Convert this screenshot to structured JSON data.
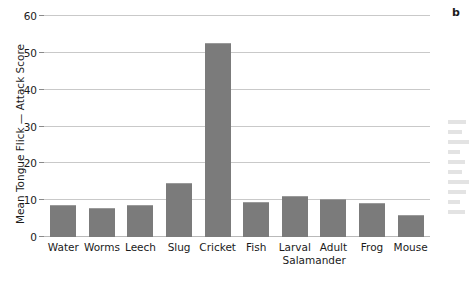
{
  "panel": {
    "letter": "b"
  },
  "chart_data": {
    "type": "bar",
    "title": "",
    "xlabel": "",
    "ylabel": "Mean Tongue Flick — Attack Score",
    "ylim": [
      0,
      60
    ],
    "yticks": [
      0,
      10,
      20,
      30,
      40,
      50,
      60
    ],
    "ytick_labels": [
      "0",
      "10",
      "20",
      "30",
      "40",
      "50",
      "60"
    ],
    "grid": true,
    "legend": "none",
    "bar_color": "#7b7b7b",
    "gridline_color": "#c9c9c9",
    "categories": [
      "Water",
      "Worms",
      "Leech",
      "Slug",
      "Cricket",
      "Fish",
      "Larval",
      "Adult",
      "Frog",
      "Mouse"
    ],
    "category_sublabel": "Salamander",
    "values": [
      8.6,
      8.0,
      8.6,
      14.7,
      52.7,
      9.6,
      11.1,
      10.3,
      9.3,
      6.0
    ]
  }
}
